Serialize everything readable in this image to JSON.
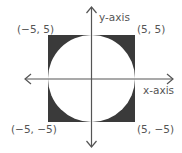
{
  "diagram": {
    "axes": {
      "x_label": "x-axis",
      "y_label": "y-axis"
    },
    "square": {
      "fill": "#3a3a3a",
      "corners": [
        "(−5, 5)",
        "(5, 5)",
        "(−5, −5)",
        "(5, −5)"
      ]
    },
    "circle": {
      "fill": "#ffffff",
      "radius": 5,
      "center": [
        0,
        0
      ]
    },
    "labels": {
      "top_left": "(−5, 5)",
      "top_right": "(5, 5)",
      "bottom_left": "(−5, −5)",
      "bottom_right": "(5, −5)"
    },
    "colors": {
      "shade": "#3a3a3a",
      "axis": "#555555",
      "text": "#555555"
    }
  }
}
